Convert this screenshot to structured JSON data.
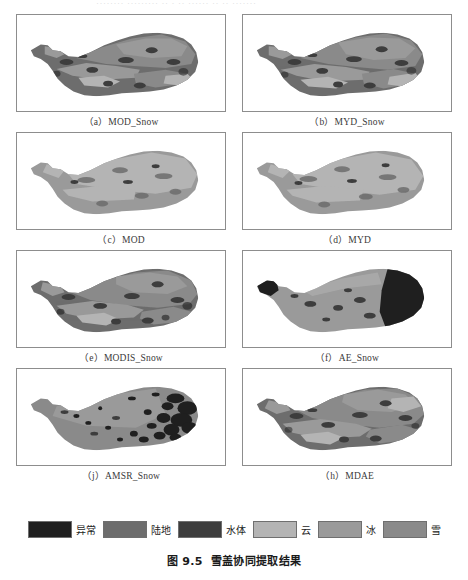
{
  "document": {
    "top_clipped_text": "········ ·········  ··  ·  ··  ······ ··  ··  ·······",
    "figure_caption_number": "图 9.5",
    "figure_caption_title": "雪盖协同提取结果"
  },
  "figure": {
    "panels": [
      {
        "id": "a",
        "label": "（a）MOD_Snow",
        "name": "MOD_Snow"
      },
      {
        "id": "b",
        "label": "（b）MYD_Snow",
        "name": "MYD_Snow"
      },
      {
        "id": "c",
        "label": "（c）MOD",
        "name": "MOD"
      },
      {
        "id": "d",
        "label": "（d）MYD",
        "name": "MYD"
      },
      {
        "id": "e",
        "label": "（e）MODIS_Snow",
        "name": "MODIS_Snow"
      },
      {
        "id": "f",
        "label": "（f）AE_Snow",
        "name": "AE_Snow"
      },
      {
        "id": "j",
        "label": "（j）AMSR_Snow",
        "name": "AMSR_Snow"
      },
      {
        "id": "h",
        "label": "（h）MDAE",
        "name": "MDAE"
      }
    ]
  },
  "legend": {
    "items": [
      {
        "label": "异常",
        "color": "#1f1f1f"
      },
      {
        "label": "陆地",
        "color": "#6d6d6d"
      },
      {
        "label": "水体",
        "color": "#3d3d3d"
      },
      {
        "label": "云",
        "color": "#b4b4b4"
      },
      {
        "label": "冰",
        "color": "#9a9a9a"
      },
      {
        "label": "雪",
        "color": "#8a8a8a"
      }
    ]
  },
  "colors": {
    "anomaly": "#1f1f1f",
    "land": "#6d6d6d",
    "water": "#3d3d3d",
    "cloud": "#b4b4b4",
    "ice": "#9a9a9a",
    "snow": "#8a8a8a",
    "panel_border": "#8d8d8d",
    "background": "#ffffff"
  }
}
